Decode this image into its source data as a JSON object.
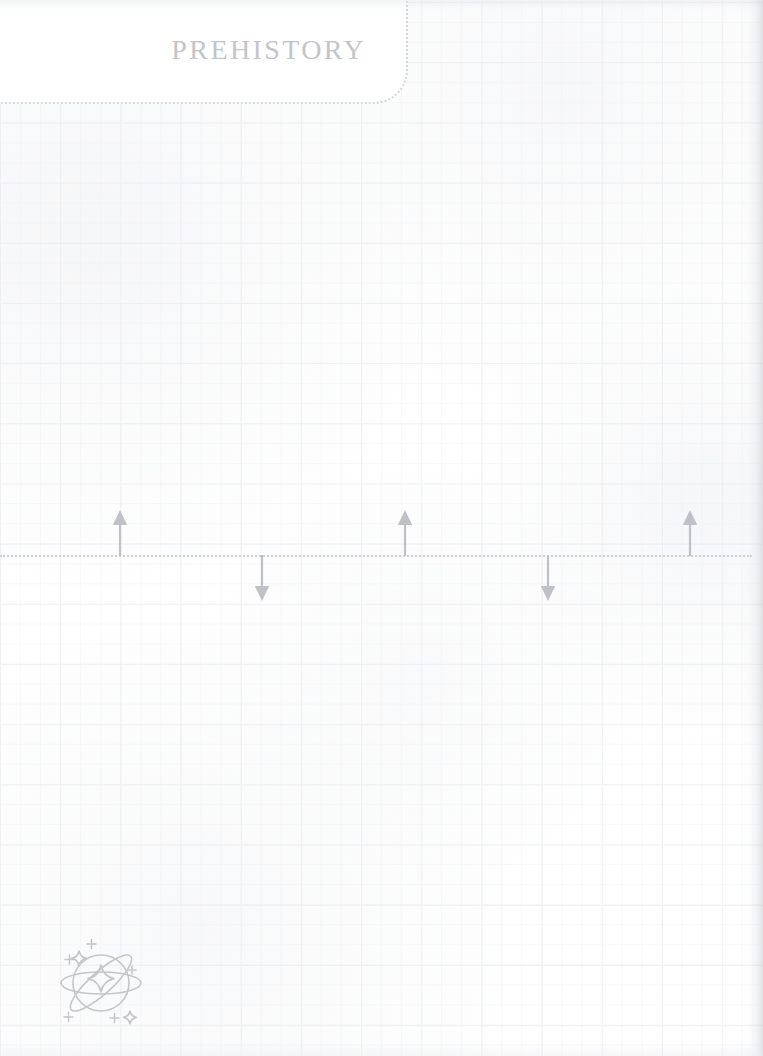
{
  "page": {
    "width": 763,
    "height": 1056,
    "background_color": "#ffffff",
    "paper_style": "graph-paper",
    "grid_color": "#eef0f2",
    "grid_spacing_px": 60
  },
  "header": {
    "title": "PREHISTORY",
    "title_color": "#c3c5ca",
    "border_style": "dotted",
    "border_color": "#d4d6da",
    "corner_radius_px": 34
  },
  "timeline": {
    "axis_label": "timeline-axis",
    "axis_color": "#cbcdd2",
    "axis_style": "dotted",
    "axis_y_px": 555,
    "marker_color": "#bfc1c6",
    "markers": [
      {
        "id": "marker-1",
        "direction": "up",
        "x_px": 120,
        "length_px": 46,
        "label": ""
      },
      {
        "id": "marker-2",
        "direction": "down",
        "x_px": 262,
        "length_px": 46,
        "label": ""
      },
      {
        "id": "marker-3",
        "direction": "up",
        "x_px": 405,
        "length_px": 46,
        "label": ""
      },
      {
        "id": "marker-4",
        "direction": "down",
        "x_px": 548,
        "length_px": 46,
        "label": ""
      },
      {
        "id": "marker-5",
        "direction": "up",
        "x_px": 690,
        "length_px": 46,
        "label": ""
      }
    ]
  },
  "decorations": {
    "space_doodle": {
      "name": "planet-sparkle-icon",
      "color": "#c4c6cb",
      "x_px": 54,
      "y_px": 932
    }
  }
}
